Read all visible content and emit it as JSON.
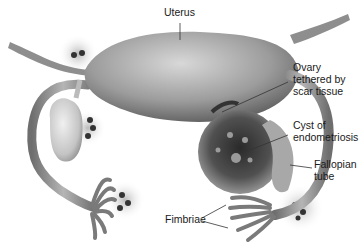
{
  "diagram": {
    "labels": {
      "uterus": "Uterus",
      "ovary_tethered": "Ovary\ntethered by\nscar tissue",
      "cyst": "Cyst of\nendometriosis",
      "fallopian_tube": "Fallopian\ntube",
      "fimbriae": "Fimbriae"
    },
    "colors": {
      "background": "#ffffff",
      "tissue_light": "#d6d6d6",
      "tissue_mid": "#9a9a9a",
      "tissue_dark": "#3a3a3a",
      "leader_line": "#333333",
      "text": "#1a1a1a"
    }
  }
}
